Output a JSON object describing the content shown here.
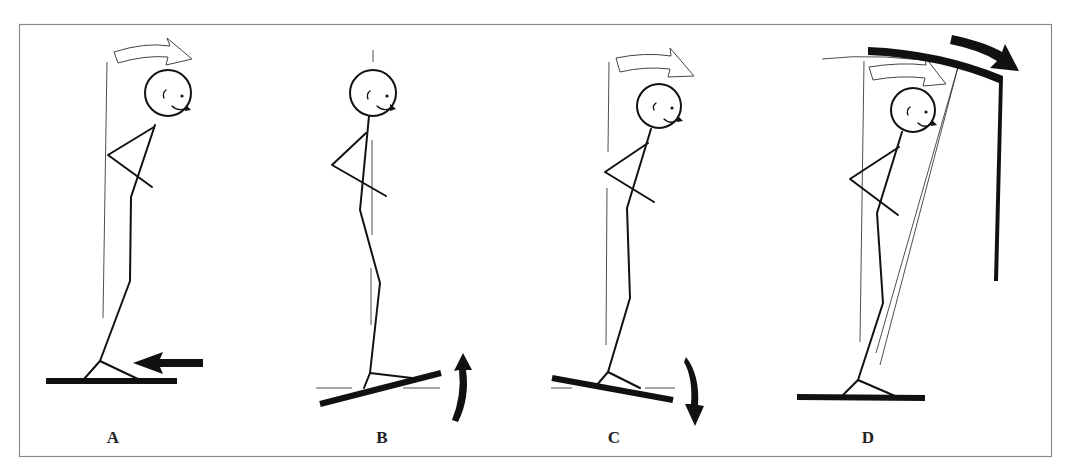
{
  "figure": {
    "panels": [
      {
        "id": "A",
        "label": "A",
        "head_tilt": "forward",
        "platform": "level",
        "arrow": "platform-pushed-backward"
      },
      {
        "id": "B",
        "label": "B",
        "head_tilt": "upright",
        "platform": "toes-up",
        "arrow": "platform-rotates-up"
      },
      {
        "id": "C",
        "label": "C",
        "head_tilt": "forward",
        "platform": "toes-down",
        "arrow": "platform-rotates-down"
      },
      {
        "id": "D",
        "label": "D",
        "head_tilt": "forward",
        "platform": "level",
        "arrow": "visual-surround-tilts-forward"
      }
    ],
    "colors": {
      "ink": "#111111",
      "frame": "#8a8a8a",
      "background": "#ffffff"
    }
  }
}
